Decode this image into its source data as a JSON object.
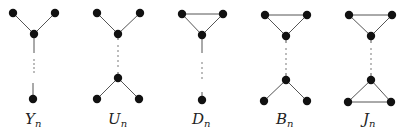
{
  "diagram": {
    "title": "",
    "graphs": [
      {
        "id": "Y",
        "label_main": "Y",
        "label_sub": "n",
        "label_pos": [
          30,
          124
        ],
        "vertices": [
          [
            13,
            13
          ],
          [
            55,
            13
          ],
          [
            34,
            34
          ],
          [
            33,
            99
          ]
        ],
        "edges": [
          [
            [
              13,
              13
            ],
            [
              34,
              34
            ]
          ],
          [
            [
              55,
              13
            ],
            [
              34,
              34
            ]
          ],
          [
            [
              34,
              34
            ],
            [
              34,
              53
            ]
          ],
          [
            [
              33,
              83
            ],
            [
              33,
              99
            ]
          ]
        ],
        "dots": [
          [
            34,
            60
          ],
          [
            34,
            64
          ],
          [
            34,
            68
          ],
          [
            34,
            72
          ]
        ]
      },
      {
        "id": "U",
        "label_main": "U",
        "label_sub": "n",
        "label_pos": [
          113,
          124
        ],
        "vertices": [
          [
            97,
            13
          ],
          [
            140,
            13
          ],
          [
            118,
            34
          ],
          [
            118,
            78
          ],
          [
            97,
            99
          ],
          [
            139,
            99
          ]
        ],
        "edges": [
          [
            [
              97,
              13
            ],
            [
              118,
              34
            ]
          ],
          [
            [
              140,
              13
            ],
            [
              118,
              34
            ]
          ],
          [
            [
              118,
              34
            ],
            [
              118,
              40
            ]
          ],
          [
            [
              118,
              72
            ],
            [
              118,
              78
            ]
          ],
          [
            [
              118,
              78
            ],
            [
              97,
              99
            ]
          ],
          [
            [
              118,
              78
            ],
            [
              139,
              99
            ]
          ]
        ],
        "dots": [
          [
            118,
            46
          ],
          [
            118,
            51
          ],
          [
            118,
            56
          ],
          [
            118,
            61
          ],
          [
            118,
            66
          ]
        ]
      },
      {
        "id": "D",
        "label_main": "D",
        "label_sub": "n",
        "label_pos": [
          196,
          124
        ],
        "vertices": [
          [
            182,
            14
          ],
          [
            223,
            14
          ],
          [
            202,
            35
          ],
          [
            202,
            100
          ]
        ],
        "edges": [
          [
            [
              182,
              14
            ],
            [
              223,
              14
            ]
          ],
          [
            [
              182,
              14
            ],
            [
              202,
              35
            ]
          ],
          [
            [
              223,
              14
            ],
            [
              202,
              35
            ]
          ],
          [
            [
              202,
              35
            ],
            [
              202,
              53
            ]
          ],
          [
            [
              202,
              92
            ],
            [
              202,
              100
            ]
          ]
        ],
        "dots": [
          [
            202,
            63
          ],
          [
            202,
            68
          ],
          [
            202,
            73
          ],
          [
            202,
            78
          ]
        ]
      },
      {
        "id": "B",
        "label_main": "B",
        "label_sub": "n",
        "label_pos": [
          280,
          124
        ],
        "vertices": [
          [
            265,
            15
          ],
          [
            307,
            15
          ],
          [
            286,
            36
          ],
          [
            286,
            80
          ],
          [
            264,
            101
          ],
          [
            307,
            101
          ]
        ],
        "edges": [
          [
            [
              265,
              15
            ],
            [
              307,
              15
            ]
          ],
          [
            [
              265,
              15
            ],
            [
              286,
              36
            ]
          ],
          [
            [
              307,
              15
            ],
            [
              286,
              36
            ]
          ],
          [
            [
              286,
              36
            ],
            [
              286,
              43
            ]
          ],
          [
            [
              286,
              73
            ],
            [
              286,
              80
            ]
          ],
          [
            [
              286,
              80
            ],
            [
              264,
              101
            ]
          ],
          [
            [
              286,
              80
            ],
            [
              307,
              101
            ]
          ]
        ],
        "dots": [
          [
            286,
            49
          ],
          [
            286,
            54
          ],
          [
            286,
            59
          ],
          [
            286,
            64
          ],
          [
            286,
            69
          ]
        ]
      },
      {
        "id": "J",
        "label_main": "J",
        "label_sub": "n",
        "label_pos": [
          366,
          124
        ],
        "vertices": [
          [
            349,
            15
          ],
          [
            392,
            15
          ],
          [
            371,
            36
          ],
          [
            371,
            80
          ],
          [
            348,
            102
          ],
          [
            391,
            102
          ]
        ],
        "edges": [
          [
            [
              349,
              15
            ],
            [
              392,
              15
            ]
          ],
          [
            [
              349,
              15
            ],
            [
              371,
              36
            ]
          ],
          [
            [
              392,
              15
            ],
            [
              371,
              36
            ]
          ],
          [
            [
              371,
              36
            ],
            [
              371,
              43
            ]
          ],
          [
            [
              371,
              73
            ],
            [
              371,
              80
            ]
          ],
          [
            [
              371,
              80
            ],
            [
              348,
              102
            ]
          ],
          [
            [
              371,
              80
            ],
            [
              391,
              102
            ]
          ],
          [
            [
              348,
              102
            ],
            [
              391,
              102
            ]
          ]
        ],
        "dots": [
          [
            371,
            49
          ],
          [
            371,
            54
          ],
          [
            371,
            59
          ],
          [
            371,
            64
          ],
          [
            371,
            69
          ]
        ]
      }
    ]
  },
  "labels": {
    "Y": {
      "main": "Y",
      "sub": "n"
    },
    "U": {
      "main": "U",
      "sub": "n"
    },
    "D": {
      "main": "D",
      "sub": "n"
    },
    "B": {
      "main": "B",
      "sub": "n"
    },
    "J": {
      "main": "J",
      "sub": "n"
    }
  },
  "style": {
    "vertex_radius": 4.2,
    "vertex_color": "#111111",
    "edge_color": "#555555",
    "background": "#ffffff"
  }
}
